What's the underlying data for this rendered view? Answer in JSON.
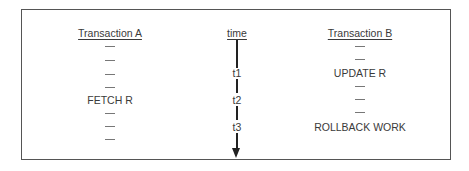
{
  "diagram": {
    "transaction_a": {
      "header": "Transaction A",
      "rows": [
        "—",
        "—",
        "—",
        "—",
        "FETCH R",
        "—",
        "—",
        "—"
      ]
    },
    "time": {
      "header": "time",
      "labels": [
        "t1",
        "t2",
        "t3"
      ]
    },
    "transaction_b": {
      "header": "Transaction B",
      "rows": [
        "—",
        "—",
        "UPDATE R",
        "—",
        "—",
        "—",
        "ROLLBACK WORK"
      ]
    }
  }
}
